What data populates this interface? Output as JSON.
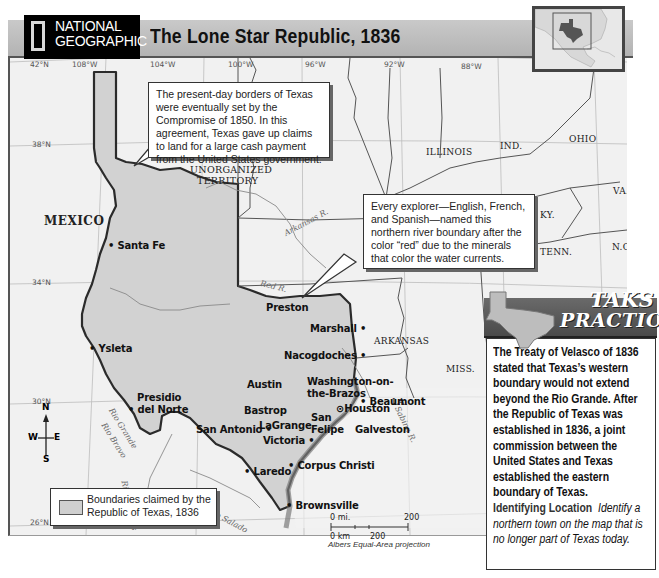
{
  "header": {
    "brand_line1": "NATIONAL",
    "brand_line2": "GEOGRAPHIC",
    "title": "The Lone Star Republic, 1836"
  },
  "locator_map": {
    "icon": "texas-locator-map"
  },
  "coordinates": {
    "longitudes": [
      "108°W",
      "104°W",
      "100°W",
      "96°W",
      "92°W",
      "88°W"
    ],
    "latitudes": [
      "42°N",
      "38°N",
      "34°N",
      "30°N",
      "26°N"
    ]
  },
  "regions": {
    "mexico": "MEXICO",
    "unorganized_line1": "UNORGANIZED",
    "unorganized_line2": "TERRITORY",
    "states": [
      "ILLINOIS",
      "IND.",
      "OHIO",
      "MISSOURI",
      "KY.",
      "VA.",
      "TENN.",
      "N.C.",
      "ARKANSAS",
      "MISS.",
      "LA."
    ]
  },
  "rivers": [
    "Arkansas R.",
    "Red R.",
    "Sabine R.",
    "Rio Grande",
    "Rio Bravo",
    "Rio Conchos",
    "Rio Salado"
  ],
  "water": {
    "gulf_line1": "Gulf of",
    "gulf_line2": "Mexico"
  },
  "cities": [
    {
      "name": "Santa Fe"
    },
    {
      "name": "Ysleta"
    },
    {
      "name": "Presidio"
    },
    {
      "name": "del Norte"
    },
    {
      "name": "San Antonio"
    },
    {
      "name": "Laredo"
    },
    {
      "name": "Brownsville"
    },
    {
      "name": "Corpus Christi"
    },
    {
      "name": "Victoria"
    },
    {
      "name": "LaGrange"
    },
    {
      "name": "Bastrop"
    },
    {
      "name": "Austin"
    },
    {
      "name": "San"
    },
    {
      "name": "Felipe"
    },
    {
      "name": "Washington-on-"
    },
    {
      "name": "the-Brazos"
    },
    {
      "name": "Houston"
    },
    {
      "name": "Galveston"
    },
    {
      "name": "Beaumont"
    },
    {
      "name": "Nacogdoches"
    },
    {
      "name": "Marshall"
    },
    {
      "name": "Preston"
    }
  ],
  "callouts": {
    "compromise": "The present-day borders of Texas were eventually set by the Compromise of 1850. In this agreement, Texas gave up claims to land for a large cash payment from the United States government.",
    "red_river": "Every explorer—English, French, and Spanish—named this northern river boundary after the color “red” due to the minerals that color the water currents."
  },
  "legend": {
    "line1": "Boundaries claimed by the",
    "line2": "Republic of Texas, 1836",
    "swatch_color": "#cfcfcf"
  },
  "scale": {
    "mi_label": "0 mi.",
    "mi_max": "200",
    "km_label": "0 km",
    "km_max": "200",
    "projection": "Albers Equal-Area projection"
  },
  "compass": {
    "n": "N",
    "s": "S",
    "e": "E",
    "w": "W"
  },
  "taks": {
    "title_line1": "TAKS",
    "title_line2": "PRACTICE",
    "body": "The Treaty of Velasco of 1836 stated that Texas’s western boundary would not extend beyond the Rio Grande. After the Republic of Texas was established in 1836, a joint commission between the United States and Texas established the eastern boundary of Texas.",
    "question_label": "Identifying Location",
    "question": "Identify a northern town on the map that is no longer part of Texas today."
  },
  "colors": {
    "claimed_fill": "#d2d2d2",
    "land": "#f1f1f1",
    "border": "#2b2b2b",
    "header_bg": "#bdbdbd",
    "taks_header": "#595959"
  }
}
